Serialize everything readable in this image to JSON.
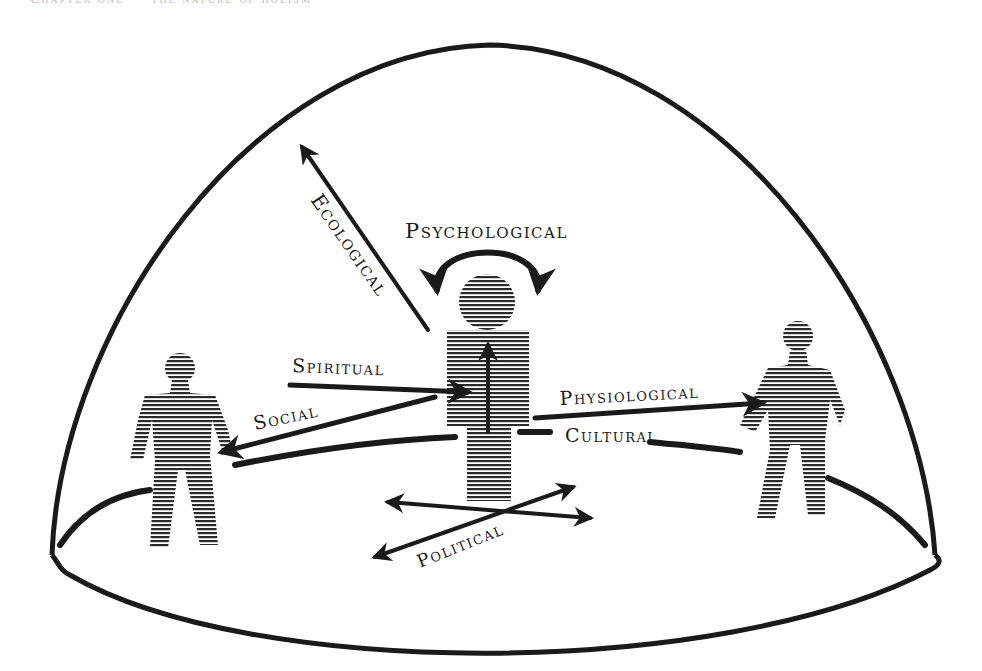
{
  "figure": {
    "header_fragment": "Chapter one — the nature of holism",
    "colors": {
      "ink": "#1a1a1a",
      "background": "#ffffff",
      "hatch": "#2a2a2a"
    },
    "labels": {
      "ecological": "Ecological",
      "psychological": "Psychological",
      "spiritual": "Spiritual",
      "social": "Social",
      "physiological": "Physiological",
      "cultural": "Cultural",
      "political": "Political"
    },
    "figures": [
      {
        "id": "left-person",
        "role": "other person"
      },
      {
        "id": "center-person",
        "role": "self"
      },
      {
        "id": "right-person",
        "role": "other person"
      }
    ]
  }
}
